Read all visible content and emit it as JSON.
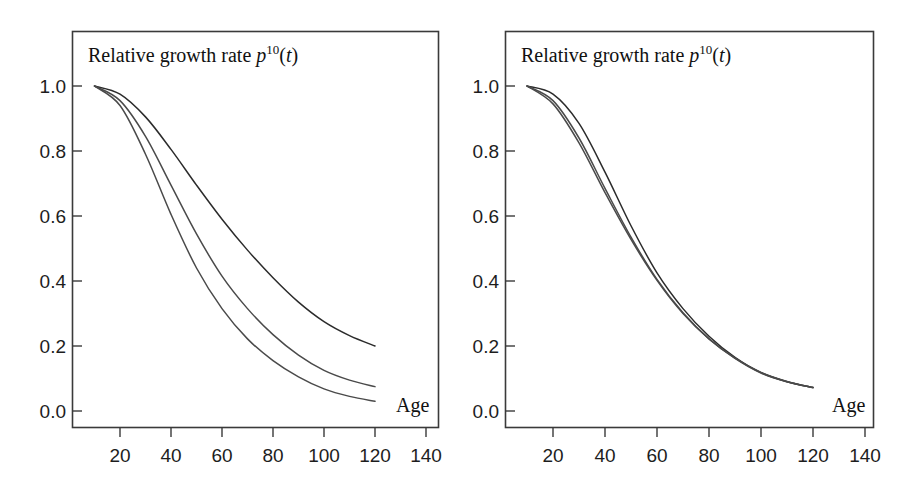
{
  "figure": {
    "background_color": "#ffffff",
    "panel_count": 2
  },
  "chart_data": [
    {
      "type": "line",
      "panel": "left",
      "title": "Relative growth rate p^10(t)",
      "title_parts": {
        "text": "Relative growth rate ",
        "symbol": "p",
        "superscript": "10",
        "argument": "(t)"
      },
      "xlabel": "Age",
      "ylabel": "",
      "xlim": [
        5,
        145
      ],
      "ylim": [
        0.0,
        1.05
      ],
      "xticks": [
        20,
        40,
        60,
        80,
        100,
        120,
        140
      ],
      "xtick_labels": [
        "20",
        "40",
        "60",
        "80",
        "100",
        "120",
        "140"
      ],
      "yticks": [
        0.0,
        0.2,
        0.4,
        0.6,
        0.8,
        1.0
      ],
      "ytick_labels": [
        "0.0",
        "0.2",
        "0.4",
        "0.6",
        "0.8",
        "1.0"
      ],
      "grid": false,
      "legend": "none",
      "x": [
        10,
        20,
        30,
        40,
        50,
        60,
        70,
        80,
        90,
        100,
        110,
        120
      ],
      "series": [
        {
          "name": "curve-upper",
          "color": "#2b2b2b",
          "values": [
            1.0,
            0.975,
            0.905,
            0.805,
            0.695,
            0.59,
            0.495,
            0.41,
            0.335,
            0.275,
            0.232,
            0.2
          ]
        },
        {
          "name": "curve-middle",
          "color": "#4a4a4a",
          "values": [
            1.0,
            0.955,
            0.845,
            0.695,
            0.545,
            0.415,
            0.315,
            0.235,
            0.172,
            0.125,
            0.095,
            0.075
          ]
        },
        {
          "name": "curve-lower",
          "color": "#4a4a4a",
          "values": [
            1.0,
            0.94,
            0.79,
            0.605,
            0.44,
            0.315,
            0.222,
            0.155,
            0.105,
            0.068,
            0.045,
            0.03
          ]
        }
      ]
    },
    {
      "type": "line",
      "panel": "right",
      "title": "Relative growth rate p^10(t)",
      "title_parts": {
        "text": "Relative growth rate ",
        "symbol": "p",
        "superscript": "10",
        "argument": "(t)"
      },
      "xlabel": "Age",
      "ylabel": "",
      "xlim": [
        5,
        145
      ],
      "ylim": [
        0.0,
        1.05
      ],
      "xticks": [
        20,
        40,
        60,
        80,
        100,
        120,
        140
      ],
      "xtick_labels": [
        "20",
        "40",
        "60",
        "80",
        "100",
        "120",
        "140"
      ],
      "yticks": [
        0.0,
        0.2,
        0.4,
        0.6,
        0.8,
        1.0
      ],
      "ytick_labels": [
        "0.0",
        "0.2",
        "0.4",
        "0.6",
        "0.8",
        "1.0"
      ],
      "grid": false,
      "legend": "none",
      "x": [
        10,
        20,
        30,
        40,
        50,
        60,
        70,
        80,
        90,
        100,
        110,
        120
      ],
      "series": [
        {
          "name": "curve-upper",
          "color": "#2b2b2b",
          "values": [
            1.0,
            0.975,
            0.885,
            0.735,
            0.57,
            0.425,
            0.315,
            0.23,
            0.165,
            0.118,
            0.09,
            0.072
          ]
        },
        {
          "name": "curve-middle",
          "color": "#4a4a4a",
          "values": [
            1.0,
            0.955,
            0.84,
            0.685,
            0.535,
            0.405,
            0.302,
            0.222,
            0.162,
            0.117,
            0.09,
            0.072
          ]
        },
        {
          "name": "curve-lower",
          "color": "#4a4a4a",
          "values": [
            1.0,
            0.945,
            0.825,
            0.672,
            0.528,
            0.402,
            0.3,
            0.222,
            0.163,
            0.119,
            0.091,
            0.072
          ]
        }
      ]
    }
  ]
}
